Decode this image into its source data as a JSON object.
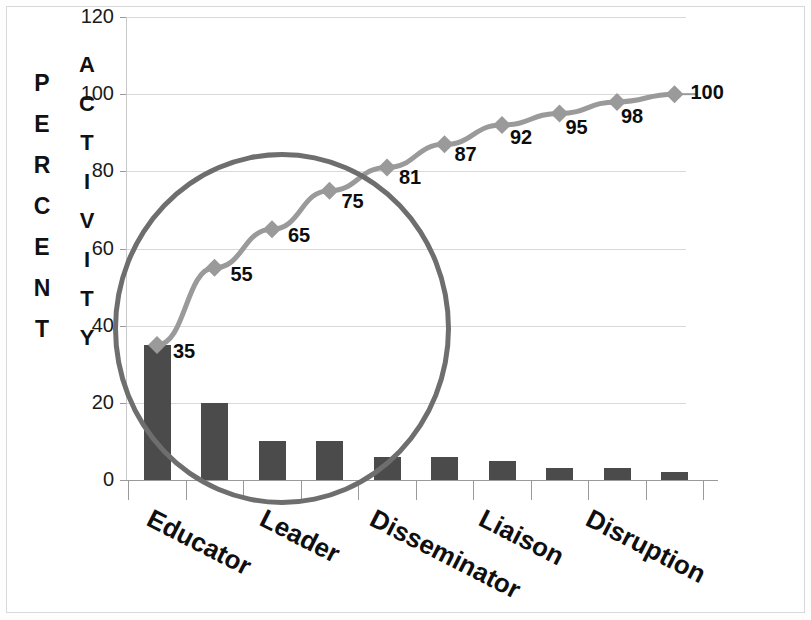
{
  "chart_data": {
    "type": "bar",
    "title": "",
    "subtitle": "",
    "xlabel": "",
    "ylabel": "PERCENT",
    "ylabel2": "ACTIVITY",
    "ylim": [
      0,
      120
    ],
    "yticks": [
      0,
      20,
      40,
      60,
      80,
      100,
      120
    ],
    "grid": true,
    "legend": "none",
    "categories": [
      "Educator",
      "",
      "Leader",
      "",
      "Disseminator",
      "",
      "Liaison",
      "",
      "Disruption",
      ""
    ],
    "visible_category_labels": [
      "Educator",
      "Leader",
      "Disseminator",
      "Liaison",
      "Disruption"
    ],
    "series": [
      {
        "name": "Activity percent",
        "type": "bar",
        "values": [
          35,
          20,
          10,
          10,
          6,
          6,
          5,
          3,
          3,
          2
        ]
      },
      {
        "name": "Cumulative percent",
        "type": "line",
        "values": [
          35,
          55,
          65,
          75,
          81,
          87,
          92,
          95,
          98,
          100
        ],
        "point_labels": [
          "35",
          "55",
          "65",
          "75",
          "81",
          "87",
          "92",
          "95",
          "98",
          "100"
        ]
      }
    ],
    "annotations": [
      {
        "name": "highlight-circle",
        "shape": "ellipse",
        "description": "Hand-drawn circle highlighting the first group of bars and the steep portion of the cumulative curve"
      }
    ],
    "colors": {
      "bar": "#4b4b4b",
      "line": "#9a9a9a",
      "marker": "#9a9a9a",
      "grid": "#d9d9d9",
      "axis": "#9a9a9a",
      "text": "#0d0d0d",
      "annotation": "#6e6e6e",
      "background": "#ffffff"
    }
  },
  "axis": {
    "y_title_letters": [
      "P",
      "E",
      "R",
      "C",
      "E",
      "N",
      "T"
    ],
    "y_title2_letters": [
      "A",
      "C",
      "T",
      "I",
      "V",
      "I",
      "T",
      "Y"
    ],
    "tick_labels": [
      "120",
      "100",
      "80",
      "60",
      "40",
      "20",
      "0"
    ]
  }
}
